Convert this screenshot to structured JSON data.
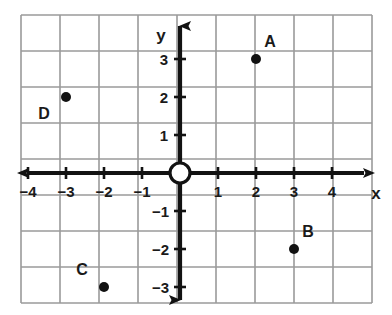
{
  "chart_data": {
    "type": "scatter",
    "title": "",
    "xlabel": "x",
    "ylabel": "y",
    "xlim": [
      -5,
      5
    ],
    "ylim": [
      -4,
      4
    ],
    "grid": true,
    "legend": null,
    "x_ticks": [
      "-4",
      "-3",
      "-2",
      "-1",
      "1",
      "2",
      "3",
      "4"
    ],
    "y_ticks": [
      "3",
      "2",
      "1",
      "-1",
      "-2",
      "-3"
    ],
    "x_tick_values": [
      -4,
      -3,
      -2,
      -1,
      1,
      2,
      3,
      4
    ],
    "y_tick_values": [
      3,
      2,
      1,
      -1,
      -2,
      -3
    ],
    "origin_marker": "open-circle",
    "points": [
      {
        "label": "A",
        "x": 2,
        "y": 3,
        "label_dx": 14,
        "label_dy": -12
      },
      {
        "label": "B",
        "x": 3,
        "y": -2,
        "label_dx": 14,
        "label_dy": -12
      },
      {
        "label": "C",
        "x": -2,
        "y": -3,
        "label_dx": -22,
        "label_dy": -12
      },
      {
        "label": "D",
        "x": -3,
        "y": 2,
        "label_dx": -22,
        "label_dy": 22
      }
    ]
  },
  "axes": {
    "x_axis_name": "x",
    "y_axis_name": "y"
  },
  "colors": {
    "grid": "#9a9a9a",
    "axis": "#121212",
    "point": "#111111",
    "background": "#ffffff",
    "text": "#1a1a1a"
  },
  "geometry": {
    "origin_x": 180,
    "origin_y": 173,
    "unit": 38,
    "grid_left": 21,
    "grid_top": 15,
    "grid_right": 372,
    "grid_bottom": 303,
    "cols": 9,
    "rows": 8,
    "dot_radius": 5,
    "origin_radius": 10
  }
}
